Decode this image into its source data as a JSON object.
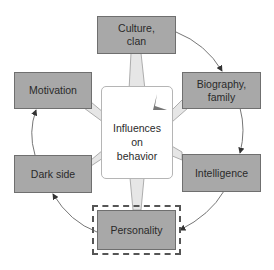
{
  "diagram": {
    "center": {
      "label": "Influences\non\nbehavior"
    },
    "nodes": [
      {
        "id": "culture",
        "label": "Culture,\nclan"
      },
      {
        "id": "biography",
        "label": "Biography,\nfamily"
      },
      {
        "id": "intelligence",
        "label": "Intelligence"
      },
      {
        "id": "personality",
        "label": "Personality",
        "highlighted": true
      },
      {
        "id": "dark_side",
        "label": "Dark side"
      },
      {
        "id": "motivation",
        "label": "Motivation"
      }
    ],
    "cycle_order": [
      "culture",
      "biography",
      "intelligence",
      "personality",
      "dark_side",
      "motivation"
    ],
    "colors": {
      "node_fill": "#a8a8a8",
      "spoke_fill": "#e4e4e4",
      "arrow": "#555555"
    }
  }
}
